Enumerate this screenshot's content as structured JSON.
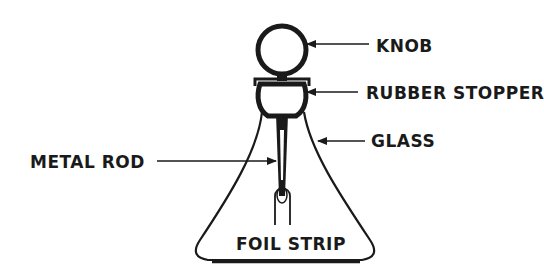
{
  "diagram": {
    "labels": {
      "knob": "KNOB",
      "rubber_stopper": "RUBBER STOPPER",
      "glass": "GLASS",
      "metal_rod": "METAL ROD",
      "foil_strip": "FOIL STRIP"
    },
    "colors": {
      "ink": "#1a1a1a",
      "background": "#ffffff"
    }
  }
}
